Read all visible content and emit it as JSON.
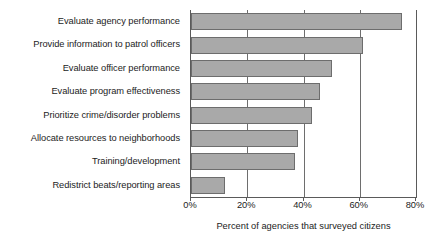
{
  "chart_data": {
    "type": "bar",
    "orientation": "horizontal",
    "title": "",
    "xlabel": "Percent of agencies that surveyed citizens",
    "ylabel": "",
    "categories": [
      "Evaluate agency performance",
      "Provide information to patrol officers",
      "Evaluate officer performance",
      "Evaluate program effectiveness",
      "Prioritize crime/disorder problems",
      "Allocate resources to neighborhoods",
      "Training/development",
      "Redistrict beats/reporting areas"
    ],
    "values": [
      75,
      61,
      50,
      46,
      43,
      38,
      37,
      12
    ],
    "xlim": [
      0,
      80
    ],
    "tick_values": [
      0,
      20,
      40,
      60,
      80
    ],
    "tick_labels": [
      "0%",
      "20%",
      "40%",
      "60%",
      "80%"
    ],
    "grid": true,
    "legend": false,
    "bar_color": "#a9a9a9",
    "bar_border_color": "#6d6d6d",
    "axis_color": "#5a5a5a",
    "background": "#ffffff"
  }
}
